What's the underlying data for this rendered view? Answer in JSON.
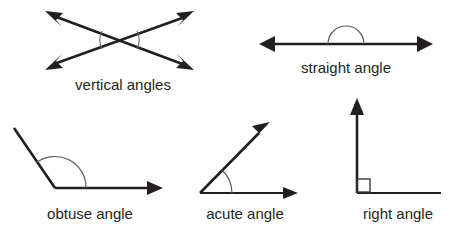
{
  "figure": {
    "background_color": "#ffffff",
    "line_color": "#231f20",
    "arc_color": "#5d5a5c",
    "label_color": "#231f20"
  },
  "diagrams": [
    {
      "id": "vertical-angles",
      "label": "vertical angles",
      "label_x": 123,
      "label_y": 90,
      "arc_count": 2,
      "arrow_count": 4,
      "description": "two straight lines crossing, forming an X"
    },
    {
      "id": "straight-angle",
      "label": "straight angle",
      "label_x": 346,
      "label_y": 73,
      "arc_count": 1,
      "arrow_count": 2,
      "description": "one straight line with double arrow and a semicircular arc above the midpoint"
    },
    {
      "id": "obtuse-angle",
      "label": "obtuse angle",
      "label_x": 90,
      "label_y": 219,
      "arc_count": 1,
      "arrow_count": 1,
      "description": "horizontal ray and an upward-left ray meeting at a vertex, angle greater than 90 degrees"
    },
    {
      "id": "acute-angle",
      "label": "acute angle",
      "label_x": 245,
      "label_y": 219,
      "arc_count": 1,
      "arrow_count": 2,
      "description": "horizontal ray and an upward-right ray meeting at a vertex, angle less than 90 degrees"
    },
    {
      "id": "right-angle",
      "label": "right angle",
      "label_x": 398,
      "label_y": 219,
      "arc_count": 0,
      "arrow_count": 1,
      "description": "vertical ray and horizontal ray meeting at a vertex with a small square marker"
    }
  ]
}
